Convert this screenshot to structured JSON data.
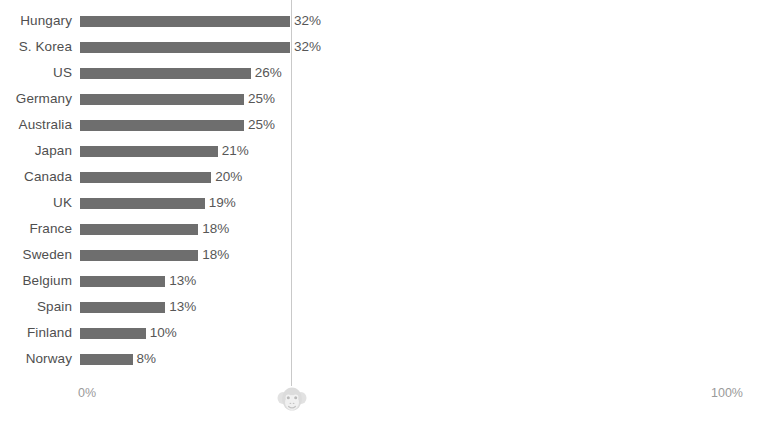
{
  "chart_data": {
    "type": "bar",
    "orientation": "horizontal",
    "title": "",
    "subtitle": "",
    "xlabel": "",
    "ylabel": "",
    "xlim": [
      0,
      100
    ],
    "grid": false,
    "legend": null,
    "value_suffix": "%",
    "categories": [
      "Hungary",
      "S. Korea",
      "US",
      "Germany",
      "Australia",
      "Japan",
      "Canada",
      "UK",
      "France",
      "Sweden",
      "Belgium",
      "Spain",
      "Finland",
      "Norway"
    ],
    "values": [
      32,
      32,
      26,
      25,
      25,
      21,
      20,
      19,
      18,
      18,
      13,
      13,
      10,
      8
    ],
    "value_labels": [
      "32%",
      "32%",
      "26%",
      "25%",
      "25%",
      "21%",
      "20%",
      "19%",
      "18%",
      "18%",
      "13%",
      "13%",
      "10%",
      "8%"
    ],
    "xticks": [
      0,
      100
    ],
    "xtick_labels": [
      "0%",
      "100%"
    ],
    "series": [
      {
        "name": "",
        "color": "#6e6e6e",
        "values": [
          32,
          32,
          26,
          25,
          25,
          21,
          20,
          19,
          18,
          18,
          13,
          13,
          10,
          8
        ]
      }
    ],
    "annotations": [
      {
        "name": "reference-line",
        "value": 32,
        "color": "#c9c9c9"
      }
    ]
  },
  "axis": {
    "left_tick": "0%",
    "right_tick": "100%"
  },
  "colors": {
    "bar": "#6e6e6e",
    "gridline": "#c9c9c9",
    "label_text": "#4f4f4f",
    "value_text": "#575757",
    "axis_text": "#9a9a9a",
    "background": "#ffffff"
  },
  "watermark": {
    "icon": "monkey-face-icon"
  }
}
